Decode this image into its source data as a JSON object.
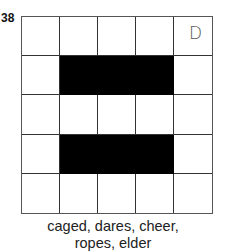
{
  "puzzle": {
    "number": "38",
    "rows": 5,
    "cols": 5,
    "black_cells": [
      [
        1,
        1
      ],
      [
        1,
        2
      ],
      [
        1,
        3
      ],
      [
        3,
        1
      ],
      [
        3,
        2
      ],
      [
        3,
        3
      ]
    ],
    "given_letters": [
      {
        "row": 0,
        "col": 4,
        "letter": "D"
      }
    ],
    "word_list_line1": "caged, dares, cheer,",
    "word_list_line2": "ropes, elder",
    "words": [
      "caged",
      "dares",
      "cheer",
      "ropes",
      "elder"
    ]
  }
}
